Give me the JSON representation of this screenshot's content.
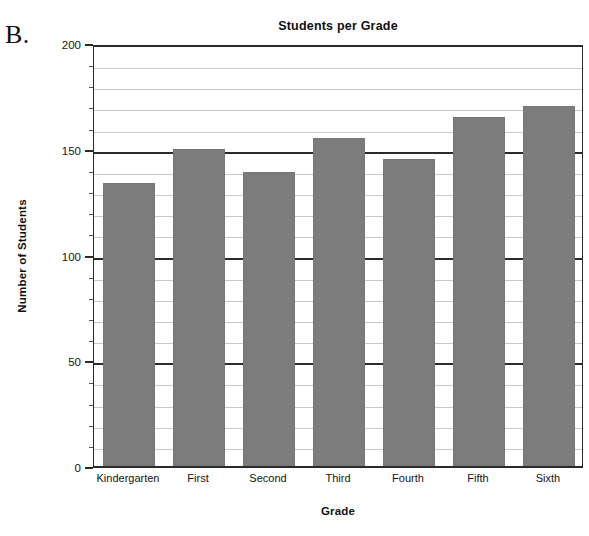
{
  "panel": {
    "letter": "B."
  },
  "chart_data": {
    "type": "bar",
    "title": "Students per Grade",
    "xlabel": "Grade",
    "ylabel": "Number of Students",
    "categories": [
      "Kindergarten",
      "First",
      "Second",
      "Third",
      "Fourth",
      "Fifth",
      "Sixth"
    ],
    "values": [
      134,
      150,
      139,
      155,
      145,
      165,
      170
    ],
    "ylim": [
      0,
      200
    ],
    "major_ticks": [
      0,
      50,
      100,
      150,
      200
    ],
    "major_tick_labels": [
      "0",
      "50",
      "100",
      "150",
      "200"
    ],
    "minor_tick_interval": 10,
    "grid": true,
    "grid_axis": "y",
    "legend": "none",
    "bar_color": "#7c7c7c",
    "axis_color": "#2b2b2b",
    "gridline_color": "#c9c9c9",
    "background": "#ffffff"
  }
}
